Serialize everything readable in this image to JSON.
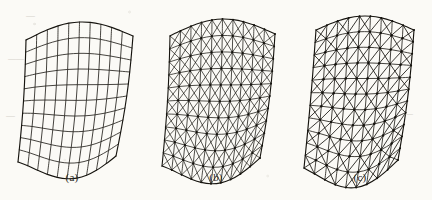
{
  "figure": {
    "background_color": "#fbfaf6",
    "ink_color": "#16140f",
    "width": 432,
    "height": 200,
    "panel_count": 3
  },
  "panels": [
    {
      "id": "a",
      "caption": "(a)",
      "mesh_type": "quadrilateral",
      "description": "Quadrilateral (four-noded) mesh of the curved shell surface",
      "u_divisions": 10,
      "v_divisions": 10,
      "shows_nodes": false,
      "left": 0
    },
    {
      "id": "b",
      "caption": "(b)",
      "mesh_type": "triangular-crisscross",
      "description": "Triangular mesh formed by inserting both diagonals in each quadrilateral cell",
      "u_divisions": 10,
      "v_divisions": 10,
      "shows_nodes": true,
      "left": 144
    },
    {
      "id": "c",
      "caption": "(c)",
      "mesh_type": "triangular-dense",
      "description": "Refined triangular mesh with single diagonals and node markers",
      "u_divisions": 9,
      "v_divisions": 11,
      "shows_nodes": true,
      "left": 288
    }
  ],
  "surface": {
    "kind": "hyperbolic-paraboloid-shell",
    "top_edge": "convex arch",
    "bottom_edge": "concave sagging curve",
    "left_edge": "converging to a sharp apex at lower left",
    "right_edge": "near-straight slanted generator"
  },
  "ghost_marks": [
    {
      "text": "—",
      "x": 26,
      "y": 10,
      "size": 9
    },
    {
      "text": "——",
      "x": 8,
      "y": 54,
      "size": 8
    },
    {
      "text": "—",
      "x": 404,
      "y": 108,
      "size": 9
    },
    {
      "text": "—",
      "x": 6,
      "y": 110,
      "size": 9
    }
  ]
}
